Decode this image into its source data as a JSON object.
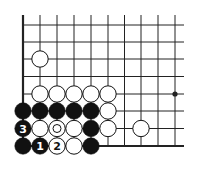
{
  "diagram": {
    "type": "go-board-fragment",
    "columns_visible": 10,
    "rows_visible": 8,
    "edges": [
      "left",
      "bottom"
    ],
    "hoshi": [
      {
        "col": 9,
        "row": 4
      }
    ],
    "stones": [
      {
        "col": 1,
        "row": 2,
        "color": "white"
      },
      {
        "col": 1,
        "row": 4,
        "color": "white"
      },
      {
        "col": 2,
        "row": 4,
        "color": "white"
      },
      {
        "col": 3,
        "row": 4,
        "color": "white"
      },
      {
        "col": 4,
        "row": 4,
        "color": "white"
      },
      {
        "col": 5,
        "row": 4,
        "color": "white"
      },
      {
        "col": 0,
        "row": 5,
        "color": "black"
      },
      {
        "col": 1,
        "row": 5,
        "color": "black"
      },
      {
        "col": 2,
        "row": 5,
        "color": "black"
      },
      {
        "col": 3,
        "row": 5,
        "color": "black"
      },
      {
        "col": 4,
        "row": 5,
        "color": "black"
      },
      {
        "col": 5,
        "row": 5,
        "color": "white"
      },
      {
        "col": 0,
        "row": 6,
        "color": "black",
        "label": "3"
      },
      {
        "col": 1,
        "row": 6,
        "color": "white"
      },
      {
        "col": 2,
        "row": 6,
        "color": "white",
        "marked": true
      },
      {
        "col": 3,
        "row": 6,
        "color": "white"
      },
      {
        "col": 4,
        "row": 6,
        "color": "black"
      },
      {
        "col": 5,
        "row": 6,
        "color": "white"
      },
      {
        "col": 7,
        "row": 6,
        "color": "white"
      },
      {
        "col": 0,
        "row": 7,
        "color": "black"
      },
      {
        "col": 1,
        "row": 7,
        "color": "black",
        "label": "1"
      },
      {
        "col": 2,
        "row": 7,
        "color": "white",
        "label": "2"
      },
      {
        "col": 3,
        "row": 7,
        "color": "white"
      },
      {
        "col": 4,
        "row": 7,
        "color": "black"
      }
    ],
    "colors": {
      "line": "#222222",
      "black_stone": "#111111",
      "white_stone": "#ffffff",
      "background": "#ffffff"
    }
  }
}
